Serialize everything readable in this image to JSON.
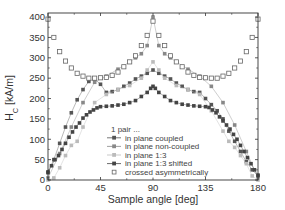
{
  "chart_data": {
    "type": "scatter",
    "title": "",
    "xlabel": "Sample angle [deg]",
    "ylabel": "H_C [kA/m]",
    "ylabel_main": "H",
    "ylabel_sub": "C",
    "ylabel_unit": " [kA/m]",
    "xlim": [
      0,
      180
    ],
    "ylim": [
      0,
      410
    ],
    "xticks": [
      0,
      45,
      90,
      135,
      180
    ],
    "yticks": [
      0,
      50,
      100,
      150,
      200,
      250,
      300,
      350,
      400
    ],
    "grid": false,
    "legend_position": "lower center inside",
    "legend_title": "1 pair ...",
    "series": [
      {
        "name": "in plane coupled",
        "marker": "filled-square",
        "color": "#555555",
        "line": true,
        "x": [
          0,
          5,
          10,
          15,
          20,
          25,
          30,
          35,
          40,
          45,
          50,
          55,
          60,
          65,
          70,
          75,
          80,
          85,
          90,
          95,
          100,
          105,
          110,
          115,
          120,
          125,
          130,
          135,
          140,
          145,
          150,
          155,
          160,
          165,
          170,
          175,
          180
        ],
        "values": [
          20,
          50,
          90,
          130,
          165,
          197,
          222,
          242,
          248,
          235,
          215,
          217,
          222,
          230,
          238,
          248,
          255,
          262,
          270,
          262,
          255,
          248,
          238,
          230,
          222,
          217,
          215,
          200,
          185,
          170,
          150,
          120,
          95,
          70,
          45,
          25,
          10
        ]
      },
      {
        "name": "in plane non-coupled",
        "marker": "filled-square",
        "color": "#888888",
        "line": true,
        "x": [
          0,
          10,
          20,
          30,
          40,
          50,
          60,
          70,
          75,
          80,
          85,
          90,
          95,
          100,
          105,
          110,
          120,
          130,
          140,
          150,
          160,
          170,
          180
        ],
        "values": [
          5,
          65,
          130,
          190,
          240,
          255,
          272,
          290,
          300,
          310,
          330,
          400,
          330,
          310,
          300,
          290,
          272,
          255,
          230,
          190,
          135,
          70,
          5
        ]
      },
      {
        "name": "in plane 1:3",
        "marker": "filled-square",
        "color": "#bbbbbb",
        "line": true,
        "x": [
          0,
          5,
          10,
          15,
          20,
          25,
          30,
          40,
          50,
          60,
          70,
          80,
          85,
          90,
          95,
          100,
          110,
          120,
          130,
          140,
          150,
          155,
          160,
          165,
          170,
          175,
          180
        ],
        "values": [
          0,
          5,
          30,
          60,
          85,
          95,
          130,
          190,
          210,
          222,
          232,
          250,
          270,
          290,
          270,
          250,
          232,
          222,
          210,
          170,
          120,
          95,
          80,
          60,
          40,
          10,
          0
        ]
      },
      {
        "name": "in plane 1:3 shifted",
        "marker": "filled-square",
        "color": "#444444",
        "line": true,
        "x": [
          0,
          3,
          6,
          9,
          12,
          15,
          18,
          21,
          24,
          27,
          30,
          33,
          36,
          39,
          42,
          45,
          50,
          55,
          60,
          65,
          70,
          75,
          80,
          85,
          88,
          90,
          92,
          95,
          100,
          105,
          110,
          115,
          120,
          125,
          130,
          135,
          138,
          141,
          144,
          147,
          150,
          153,
          156,
          159,
          162,
          165,
          168,
          171,
          174,
          177,
          180
        ],
        "values": [
          18,
          35,
          50,
          60,
          75,
          90,
          105,
          118,
          130,
          140,
          152,
          160,
          167,
          172,
          177,
          180,
          181,
          182,
          184,
          186,
          190,
          195,
          205,
          215,
          225,
          230,
          225,
          215,
          205,
          195,
          190,
          186,
          184,
          182,
          181,
          180,
          178,
          172,
          165,
          155,
          145,
          135,
          125,
          112,
          100,
          85,
          70,
          55,
          40,
          25,
          12
        ]
      },
      {
        "name": "crossed asymmetrically",
        "marker": "open-square",
        "color": "#666666",
        "line": false,
        "x": [
          0,
          5,
          10,
          15,
          20,
          25,
          30,
          35,
          40,
          45,
          50,
          55,
          60,
          65,
          70,
          75,
          80,
          85,
          90,
          95,
          100,
          105,
          110,
          115,
          120,
          125,
          130,
          135,
          140,
          145,
          150,
          155,
          160,
          165,
          170,
          175,
          180
        ],
        "values": [
          395,
          350,
          315,
          292,
          275,
          262,
          255,
          250,
          250,
          251,
          252,
          257,
          265,
          278,
          290,
          305,
          330,
          355,
          390,
          355,
          330,
          305,
          290,
          278,
          265,
          257,
          252,
          251,
          250,
          250,
          255,
          262,
          275,
          292,
          315,
          350,
          395
        ]
      }
    ]
  }
}
